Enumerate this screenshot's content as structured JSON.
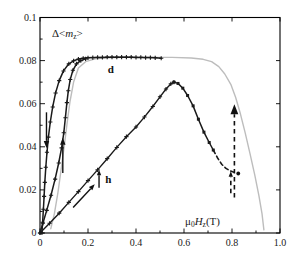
{
  "chart_data": {
    "type": "line",
    "title": "",
    "xlabel": "μ0Hz(T)",
    "ylabel": "Δ<mz>",
    "ylabel_parts": {
      "pre": "Δ<",
      "sym": "m",
      "sub": "z",
      "post": ">"
    },
    "xlabel_parts": {
      "sym1": "μ",
      "sub1": "0",
      "sym2": "H",
      "sub2": "z",
      "post": "(T)"
    },
    "xlim": [
      0,
      1.0
    ],
    "ylim": [
      0,
      0.1
    ],
    "xticks": [
      {
        "v": 0,
        "label": "0"
      },
      {
        "v": 0.2,
        "label": "0.2"
      },
      {
        "v": 0.4,
        "label": "0.4"
      },
      {
        "v": 0.6,
        "label": "0.6"
      },
      {
        "v": 0.8,
        "label": "0.8"
      },
      {
        "v": 1.0,
        "label": "1.0"
      }
    ],
    "yticks": [
      {
        "v": 0,
        "label": "0"
      },
      {
        "v": 0.02,
        "label": "0.02"
      },
      {
        "v": 0.04,
        "label": "0.04"
      },
      {
        "v": 0.06,
        "label": "0.06"
      },
      {
        "v": 0.08,
        "label": "0.08"
      },
      {
        "v": 0.1,
        "label": "0.1"
      }
    ],
    "x_minor_step": 0.1,
    "y_minor_step": 0.01,
    "grid": false,
    "legend": "none",
    "colors": {
      "curve_black": "#1a1a1a",
      "curve_gray": "#bdbdbd",
      "frame": "#000000"
    },
    "series": [
      {
        "name": "gray-loop",
        "color": "#bdbdbd",
        "width": 1.4,
        "dash": "",
        "marker": "none",
        "points": [
          [
            0.045,
            0.002
          ],
          [
            0.06,
            0.009
          ],
          [
            0.075,
            0.019
          ],
          [
            0.09,
            0.031
          ],
          [
            0.103,
            0.042
          ],
          [
            0.114,
            0.052
          ],
          [
            0.125,
            0.061
          ],
          [
            0.14,
            0.07
          ],
          [
            0.16,
            0.0765
          ],
          [
            0.19,
            0.0795
          ],
          [
            0.23,
            0.0808
          ],
          [
            0.28,
            0.0813
          ],
          [
            0.35,
            0.0815
          ],
          [
            0.45,
            0.0815
          ],
          [
            0.55,
            0.0815
          ],
          [
            0.63,
            0.0812
          ],
          [
            0.68,
            0.0806
          ],
          [
            0.715,
            0.0795
          ],
          [
            0.745,
            0.0772
          ],
          [
            0.77,
            0.0738
          ],
          [
            0.795,
            0.069
          ],
          [
            0.815,
            0.063
          ],
          [
            0.835,
            0.0553
          ],
          [
            0.855,
            0.0465
          ],
          [
            0.875,
            0.0368
          ],
          [
            0.895,
            0.0268
          ],
          [
            0.912,
            0.0173
          ],
          [
            0.925,
            0.009
          ],
          [
            0.933,
            0.0015
          ]
        ]
      },
      {
        "name": "d-branch-decreasing",
        "color": "#1a1a1a",
        "width": 1.5,
        "dash": "",
        "marker": "plus",
        "points": [
          [
            0.008,
            0.0
          ],
          [
            0.011,
            0.005
          ],
          [
            0.014,
            0.011
          ],
          [
            0.017,
            0.017
          ],
          [
            0.02,
            0.0235
          ],
          [
            0.024,
            0.0305
          ],
          [
            0.029,
            0.0375
          ],
          [
            0.035,
            0.0445
          ],
          [
            0.043,
            0.0515
          ],
          [
            0.053,
            0.0585
          ],
          [
            0.065,
            0.065
          ],
          [
            0.08,
            0.0707
          ],
          [
            0.098,
            0.0752
          ],
          [
            0.12,
            0.0785
          ],
          [
            0.14,
            0.0799
          ],
          [
            0.16,
            0.0807
          ],
          [
            0.18,
            0.0811
          ],
          [
            0.2,
            0.0813
          ],
          [
            0.22,
            0.0814
          ],
          [
            0.24,
            0.0815
          ],
          [
            0.26,
            0.0815
          ],
          [
            0.28,
            0.0816
          ],
          [
            0.3,
            0.0816
          ],
          [
            0.32,
            0.0816
          ],
          [
            0.34,
            0.0816
          ],
          [
            0.36,
            0.0816
          ],
          [
            0.38,
            0.0816
          ],
          [
            0.4,
            0.0815
          ],
          [
            0.42,
            0.0815
          ],
          [
            0.44,
            0.0814
          ],
          [
            0.46,
            0.0814
          ],
          [
            0.48,
            0.0813
          ],
          [
            0.505,
            0.0811
          ]
        ]
      },
      {
        "name": "d-branch-increasing",
        "color": "#1a1a1a",
        "width": 1.5,
        "dash": "",
        "marker": "plus",
        "points": [
          [
            0.0,
            0.0
          ],
          [
            0.012,
            0.0045
          ],
          [
            0.028,
            0.0105
          ],
          [
            0.046,
            0.0175
          ],
          [
            0.063,
            0.025
          ],
          [
            0.078,
            0.0325
          ],
          [
            0.09,
            0.0395
          ],
          [
            0.099,
            0.0465
          ],
          [
            0.106,
            0.0535
          ],
          [
            0.112,
            0.0605
          ],
          [
            0.118,
            0.066
          ],
          [
            0.126,
            0.0712
          ],
          [
            0.137,
            0.0755
          ],
          [
            0.152,
            0.0785
          ],
          [
            0.17,
            0.08
          ],
          [
            0.19,
            0.0808
          ]
        ]
      },
      {
        "name": "h-branch-ascending",
        "color": "#1a1a1a",
        "width": 1.4,
        "dash": "",
        "marker": "plus",
        "points": [
          [
            0.0,
            0.0
          ],
          [
            0.04,
            0.0045
          ],
          [
            0.08,
            0.0092
          ],
          [
            0.12,
            0.0142
          ],
          [
            0.16,
            0.0192
          ],
          [
            0.2,
            0.0243
          ],
          [
            0.24,
            0.0293
          ],
          [
            0.28,
            0.0345
          ],
          [
            0.32,
            0.0397
          ],
          [
            0.36,
            0.0447
          ],
          [
            0.4,
            0.0492
          ],
          [
            0.435,
            0.0538
          ],
          [
            0.47,
            0.0587
          ],
          [
            0.5,
            0.0632
          ],
          [
            0.525,
            0.0668
          ],
          [
            0.545,
            0.0692
          ],
          [
            0.558,
            0.07
          ]
        ]
      },
      {
        "name": "h-branch-descending-solid",
        "color": "#1a1a1a",
        "width": 1.5,
        "dash": "",
        "marker": "square",
        "points": [
          [
            0.558,
            0.07
          ],
          [
            0.575,
            0.0694
          ],
          [
            0.595,
            0.0672
          ],
          [
            0.615,
            0.0638
          ],
          [
            0.638,
            0.059
          ],
          [
            0.66,
            0.0528
          ],
          [
            0.683,
            0.0468
          ],
          [
            0.705,
            0.042
          ],
          [
            0.722,
            0.0385
          ]
        ]
      },
      {
        "name": "h-branch-descending-dashed",
        "color": "#1a1a1a",
        "width": 1.6,
        "dash": "4,3",
        "marker": "none",
        "points": [
          [
            0.722,
            0.0385
          ],
          [
            0.74,
            0.0348
          ],
          [
            0.758,
            0.0318
          ],
          [
            0.775,
            0.03
          ],
          [
            0.792,
            0.0288
          ],
          [
            0.808,
            0.0282
          ]
        ]
      }
    ],
    "arrows": [
      {
        "name": "down-arrow-decreasing-branch",
        "from": [
          0.027,
          0.056
        ],
        "to": [
          0.027,
          0.0395
        ],
        "dashed": false,
        "head": 7
      },
      {
        "name": "up-arrow-increasing-branch",
        "from": [
          0.095,
          0.0278
        ],
        "to": [
          0.095,
          0.0442
        ],
        "dashed": false,
        "head": 7
      },
      {
        "name": "diagonal-arrow-h-ascending",
        "from": [
          0.138,
          0.0118
        ],
        "to": [
          0.228,
          0.0226
        ],
        "dashed": false,
        "head": 6
      },
      {
        "name": "small-up-arrow-h",
        "from": [
          0.246,
          0.021
        ],
        "to": [
          0.246,
          0.0293
        ],
        "dashed": false,
        "head": 5.5
      },
      {
        "name": "large-dashed-up-arrow",
        "from": [
          0.81,
          0.0165
        ],
        "to": [
          0.81,
          0.0597
        ],
        "dashed": true,
        "head": 10
      },
      {
        "name": "small-dashed-up-arrow",
        "from": [
          0.795,
          0.0185
        ],
        "to": [
          0.795,
          0.0286
        ],
        "dashed": true,
        "head": 5.5
      }
    ],
    "end_dot": {
      "H": 0.826,
      "V": 0.0276
    },
    "labels": [
      {
        "text": "d",
        "H": 0.295,
        "V": 0.0762
      },
      {
        "text": "h",
        "H": 0.285,
        "V": 0.0252
      }
    ]
  }
}
